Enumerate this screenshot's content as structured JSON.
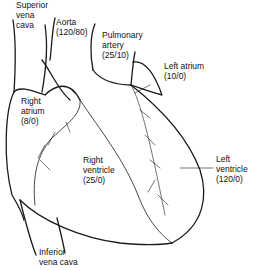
{
  "diagram": {
    "stroke_color": "#1a1a1a",
    "background": "#ffffff",
    "labels": {
      "superior_vena_cava": {
        "line1": "Superior",
        "line2": "vena",
        "line3": "cava"
      },
      "aorta": {
        "line1": "Aorta",
        "line2": "(120/80)"
      },
      "pulmonary_artery": {
        "line1": "Pulmonary",
        "line2": "artery",
        "line3": "(25/10)"
      },
      "left_atrium": {
        "line1": "Left atrium",
        "line2": "(10/0)"
      },
      "right_atrium": {
        "line1": "Right",
        "line2": "atrium",
        "line3": "(8/0)"
      },
      "right_ventricle": {
        "line1": "Right",
        "line2": "ventricle",
        "line3": "(25/0)"
      },
      "left_ventricle": {
        "line1": "Left",
        "line2": "ventricle",
        "line3": "(120/0)"
      },
      "inferior_vena_cava": {
        "line1": "Inferior",
        "line2": "vena cava"
      }
    }
  }
}
